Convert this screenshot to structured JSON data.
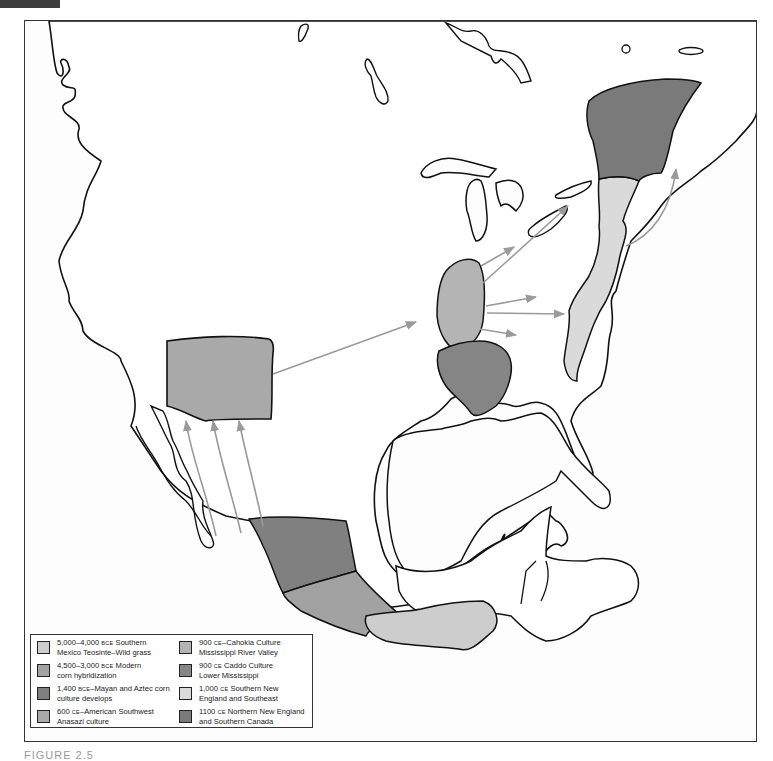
{
  "figure": {
    "caption": "FIGURE 2.5"
  },
  "map": {
    "title": "Spread of corn cultivation across North America",
    "colors": {
      "stroke": "#111111",
      "arrow": "#9a9a9a",
      "background": "#fdfdfd",
      "land": "#ffffff"
    },
    "regions": [
      {
        "id": "southwest",
        "legend_index": 3,
        "fill": "#a9a9a9"
      },
      {
        "id": "mexico-north",
        "legend_index": 2,
        "fill": "#808080"
      },
      {
        "id": "mexico-central",
        "legend_index": 1,
        "fill": "#a2a2a2"
      },
      {
        "id": "mexico-south",
        "legend_index": 0,
        "fill": "#cdcdcd"
      },
      {
        "id": "cahokia",
        "legend_index": 4,
        "fill": "#b4b4b4"
      },
      {
        "id": "caddo",
        "legend_index": 5,
        "fill": "#858585"
      },
      {
        "id": "southern-new-england",
        "legend_index": 6,
        "fill": "#dadada"
      },
      {
        "id": "northern-new-england",
        "legend_index": 7,
        "fill": "#7a7a7a"
      }
    ]
  },
  "legend": {
    "items": [
      {
        "date": "5,000–4,000",
        "era": "BCE",
        "line1_rest": " Southern",
        "line2": "Mexico Teosinte–Wild grass",
        "color": "#cdcdcd"
      },
      {
        "date": "4,500–3,000",
        "era": "BCE",
        "line1_rest": " Modern",
        "line2": "corn hybridization",
        "color": "#a2a2a2"
      },
      {
        "date": "1,400",
        "era": "BCE",
        "line1_rest": "–Mayan and Aztec corn",
        "line2": "culture develops",
        "color": "#808080"
      },
      {
        "date": "600",
        "era": "CE",
        "line1_rest": "–American Southwest",
        "line2": "Anasazi culture",
        "color": "#a9a9a9"
      },
      {
        "date": "900",
        "era": "CE",
        "line1_rest": "–Cahokia Culture",
        "line2": "Mississippi River Valley",
        "color": "#b4b4b4"
      },
      {
        "date": "900",
        "era": "CE",
        "line1_rest": " Caddo Culture",
        "line2": "Lower Mississippi",
        "color": "#858585"
      },
      {
        "date": "1,000",
        "era": "CE",
        "line1_rest": " Southern New",
        "line2": "England and Southeast",
        "color": "#dadada"
      },
      {
        "date": "1100",
        "era": "CE",
        "line1_rest": " Northern New England",
        "line2": "and Southern Canada",
        "color": "#7a7a7a"
      }
    ]
  }
}
